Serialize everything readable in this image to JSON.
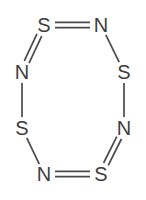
{
  "figure": {
    "width": 146,
    "height": 200,
    "background_color": "#ffffff",
    "bond_color": "#4a4a4a",
    "atom_color": "#3d3d3d"
  },
  "atoms": [
    {
      "id": "s-top-left",
      "label": "S",
      "x": 44,
      "y": 25
    },
    {
      "id": "n-top-right",
      "label": "N",
      "x": 101,
      "y": 25
    },
    {
      "id": "s-right-upper",
      "label": "S",
      "x": 124,
      "y": 72
    },
    {
      "id": "n-right-lower",
      "label": "N",
      "x": 124,
      "y": 128
    },
    {
      "id": "s-bottom-right",
      "label": "S",
      "x": 101,
      "y": 174
    },
    {
      "id": "n-bottom-left",
      "label": "N",
      "x": 44,
      "y": 174
    },
    {
      "id": "s-left-lower",
      "label": "S",
      "x": 22,
      "y": 128
    },
    {
      "id": "n-left-upper",
      "label": "N",
      "x": 22,
      "y": 72
    }
  ],
  "bonds": [
    {
      "id": "bond-s-top-left--n-top-right",
      "from": "s-top-left",
      "to": "n-top-right",
      "order": 2
    },
    {
      "id": "bond-n-top-right--s-right-upper",
      "from": "n-top-right",
      "to": "s-right-upper",
      "order": 1
    },
    {
      "id": "bond-s-right-upper--n-right-lower",
      "from": "s-right-upper",
      "to": "n-right-lower",
      "order": 1
    },
    {
      "id": "bond-n-right-lower--s-bottom-right",
      "from": "n-right-lower",
      "to": "s-bottom-right",
      "order": 2
    },
    {
      "id": "bond-s-bottom-right--n-bottom-left",
      "from": "s-bottom-right",
      "to": "n-bottom-left",
      "order": 2
    },
    {
      "id": "bond-n-bottom-left--s-left-lower",
      "from": "n-bottom-left",
      "to": "s-left-lower",
      "order": 1
    },
    {
      "id": "bond-s-left-lower--n-left-upper",
      "from": "s-left-lower",
      "to": "n-left-upper",
      "order": 1
    },
    {
      "id": "bond-n-left-upper--s-top-left",
      "from": "n-left-upper",
      "to": "s-top-left",
      "order": 2
    }
  ],
  "render": {
    "atom_gap": 11,
    "double_bond_offset": 2.6,
    "font_size": 20
  }
}
